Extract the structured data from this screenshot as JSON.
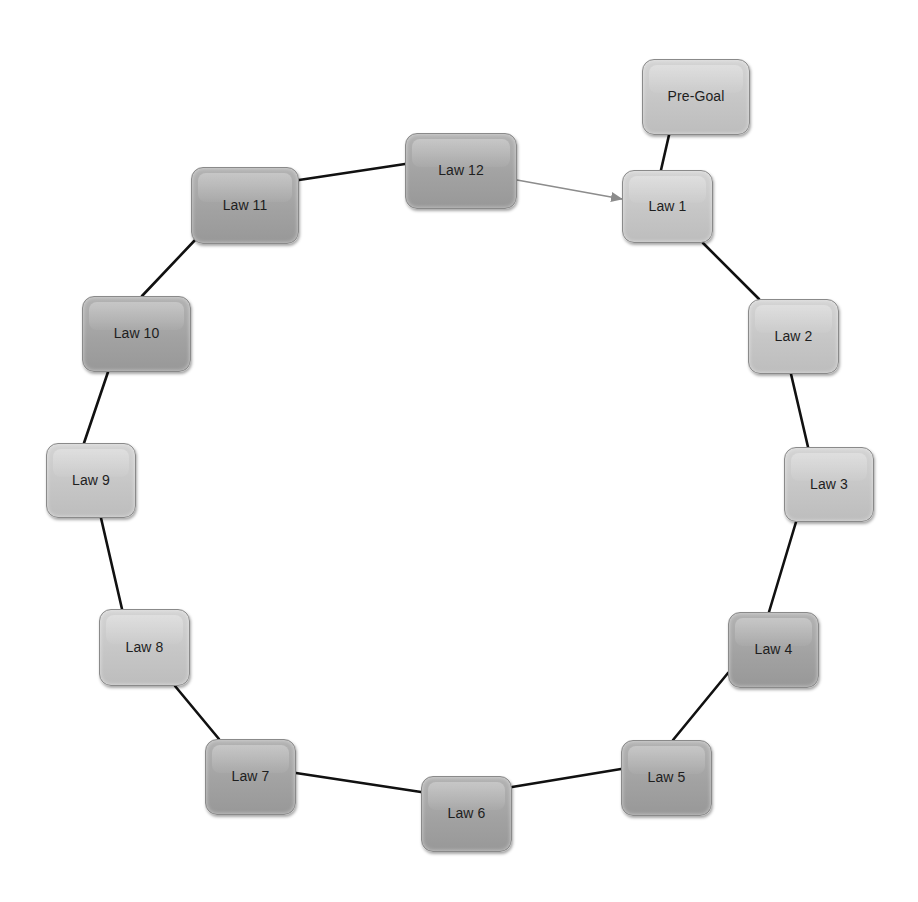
{
  "diagram": {
    "type": "cycle",
    "colors": {
      "background": "#ffffff",
      "node_light": "#c8c8c8",
      "node_dark": "#a4a4a4",
      "node_border": "#8a8a8a",
      "edge": "#111111",
      "arrow_edge": "#8c8c8c",
      "text": "#1e1e1e"
    },
    "nodes": [
      {
        "id": "pre-goal",
        "label": "Pre-Goal",
        "x": 642,
        "y": 59,
        "w": 108,
        "h": 76,
        "shade": "light"
      },
      {
        "id": "law-1",
        "label": "Law 1",
        "x": 622,
        "y": 170,
        "w": 91,
        "h": 73,
        "shade": "light"
      },
      {
        "id": "law-2",
        "label": "Law 2",
        "x": 748,
        "y": 299,
        "w": 91,
        "h": 75,
        "shade": "light"
      },
      {
        "id": "law-3",
        "label": "Law 3",
        "x": 784,
        "y": 447,
        "w": 90,
        "h": 75,
        "shade": "light"
      },
      {
        "id": "law-4",
        "label": "Law 4",
        "x": 728,
        "y": 612,
        "w": 91,
        "h": 76,
        "shade": "dark"
      },
      {
        "id": "law-5",
        "label": "Law 5",
        "x": 621,
        "y": 740,
        "w": 91,
        "h": 76,
        "shade": "dark"
      },
      {
        "id": "law-6",
        "label": "Law 6",
        "x": 421,
        "y": 776,
        "w": 91,
        "h": 76,
        "shade": "dark"
      },
      {
        "id": "law-7",
        "label": "Law 7",
        "x": 205,
        "y": 739,
        "w": 91,
        "h": 76,
        "shade": "dark"
      },
      {
        "id": "law-8",
        "label": "Law 8",
        "x": 99,
        "y": 609,
        "w": 91,
        "h": 77,
        "shade": "light"
      },
      {
        "id": "law-9",
        "label": "Law 9",
        "x": 46,
        "y": 443,
        "w": 90,
        "h": 75,
        "shade": "light"
      },
      {
        "id": "law-10",
        "label": "Law 10",
        "x": 82,
        "y": 296,
        "w": 109,
        "h": 76,
        "shade": "dark"
      },
      {
        "id": "law-11",
        "label": "Law 11",
        "x": 191,
        "y": 167,
        "w": 108,
        "h": 77,
        "shade": "dark"
      },
      {
        "id": "law-12",
        "label": "Law 12",
        "x": 405,
        "y": 133,
        "w": 112,
        "h": 76,
        "shade": "dark"
      }
    ],
    "edges": [
      {
        "from": "pre-goal",
        "to": "law-1",
        "x1": 669,
        "y1": 135,
        "x2": 661,
        "y2": 170,
        "style": "solid"
      },
      {
        "from": "law-1",
        "to": "law-2",
        "x1": 703,
        "y1": 243,
        "x2": 759,
        "y2": 299,
        "style": "solid"
      },
      {
        "from": "law-2",
        "to": "law-3",
        "x1": 791,
        "y1": 374,
        "x2": 808,
        "y2": 447,
        "style": "solid"
      },
      {
        "from": "law-3",
        "to": "law-4",
        "x1": 796,
        "y1": 522,
        "x2": 769,
        "y2": 612,
        "style": "solid"
      },
      {
        "from": "law-4",
        "to": "law-5",
        "x1": 728,
        "y1": 673,
        "x2": 673,
        "y2": 740,
        "style": "solid"
      },
      {
        "from": "law-5",
        "to": "law-6",
        "x1": 621,
        "y1": 769,
        "x2": 512,
        "y2": 787,
        "style": "solid"
      },
      {
        "from": "law-6",
        "to": "law-7",
        "x1": 421,
        "y1": 792,
        "x2": 296,
        "y2": 773,
        "style": "solid"
      },
      {
        "from": "law-7",
        "to": "law-8",
        "x1": 219,
        "y1": 739,
        "x2": 175,
        "y2": 686,
        "style": "solid"
      },
      {
        "from": "law-8",
        "to": "law-9",
        "x1": 122,
        "y1": 609,
        "x2": 101,
        "y2": 518,
        "style": "solid"
      },
      {
        "from": "law-9",
        "to": "law-10",
        "x1": 84,
        "y1": 443,
        "x2": 108,
        "y2": 372,
        "style": "solid"
      },
      {
        "from": "law-10",
        "to": "law-11",
        "x1": 142,
        "y1": 296,
        "x2": 196,
        "y2": 239,
        "style": "solid"
      },
      {
        "from": "law-11",
        "to": "law-12",
        "x1": 299,
        "y1": 180,
        "x2": 405,
        "y2": 164,
        "style": "solid"
      },
      {
        "from": "law-12",
        "to": "law-1",
        "x1": 517,
        "y1": 180,
        "x2": 622,
        "y2": 199,
        "style": "arrow"
      }
    ]
  }
}
